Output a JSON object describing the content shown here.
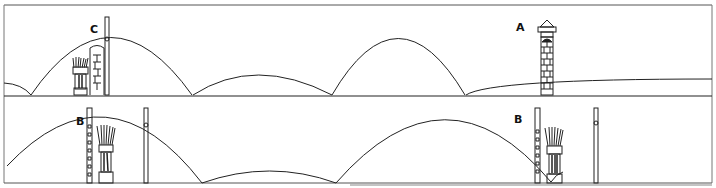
{
  "figure": {
    "stroke_color": "#222222",
    "panels": [
      {
        "name": "top-panel",
        "labels": [
          {
            "id": "C",
            "text": "C"
          },
          {
            "id": "A",
            "text": "A"
          }
        ]
      },
      {
        "name": "bottom-panel",
        "labels": [
          {
            "id": "B1",
            "text": "B"
          },
          {
            "id": "B2",
            "text": "B"
          }
        ]
      }
    ]
  }
}
